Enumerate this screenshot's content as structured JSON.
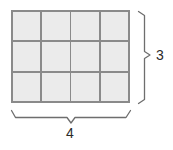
{
  "figure": {
    "type": "rectangle-area-grid-diagram",
    "grid": {
      "columns": 4,
      "rows": 3,
      "total_cells": 12,
      "cell_fill_color": "#ebebeb",
      "cell_border_color": "#8a8a8a"
    },
    "dimensions": {
      "height": {
        "value": "3",
        "position": "right",
        "bracket": "vertical-brace"
      },
      "width": {
        "value": "4",
        "position": "bottom",
        "bracket": "horizontal-brace"
      }
    },
    "stroke_color": "#6e6e6e",
    "label_color": "#2b2b2b",
    "background_color": "#ffffff"
  }
}
